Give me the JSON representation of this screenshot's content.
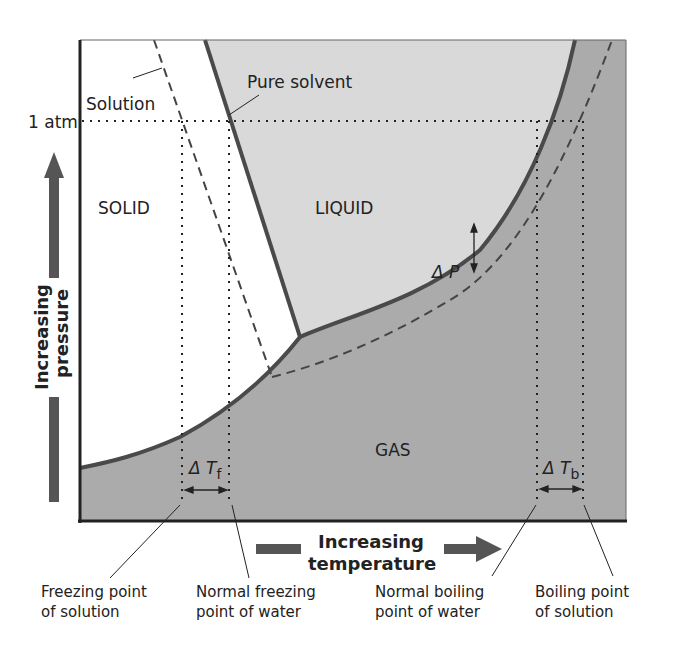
{
  "diagram": {
    "colors": {
      "solid_region": "#ffffff",
      "liquid_region": "#d9d9d9",
      "gas_region": "#ababab",
      "curve": "#4a4a4a",
      "arrow": "#555555",
      "text": "#222222"
    },
    "regions": {
      "solid": "SOLID",
      "liquid": "LIQUID",
      "gas": "GAS"
    },
    "curve_labels": {
      "pure_solvent": "Pure solvent",
      "solution": "Solution"
    },
    "axis": {
      "pressure_tick": "1 atm",
      "y_label_line1": "Increasing",
      "y_label_line2": "pressure",
      "x_label_line1": "Increasing",
      "x_label_line2": "temperature"
    },
    "deltas": {
      "delta_p": "Δ P",
      "delta_tf_main": "Δ T",
      "delta_tf_sub": "f",
      "delta_tb_main": "Δ T",
      "delta_tb_sub": "b"
    },
    "callouts": [
      {
        "line1": "Freezing point",
        "line2": "of solution"
      },
      {
        "line1": "Normal freezing",
        "line2": "point of water"
      },
      {
        "line1": "Normal boiling",
        "line2": "point of water"
      },
      {
        "line1": "Boiling point",
        "line2": "of solution"
      }
    ]
  }
}
